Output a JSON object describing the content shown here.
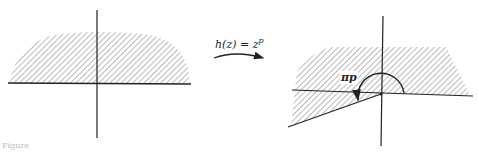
{
  "diagram": {
    "type": "conformal-mapping",
    "left_panel": {
      "description": "upper half-plane (shaded)",
      "axes": {
        "horizontal": true,
        "vertical": true
      }
    },
    "mapping": {
      "label": "h(z) = z",
      "exponent": "p",
      "arrow": "curved-right"
    },
    "right_panel": {
      "description": "sector of angle πp (shaded)",
      "angle_label": "πp",
      "axes": {
        "horizontal": true,
        "vertical": true
      }
    },
    "caption": "Figure"
  },
  "colors": {
    "ink": "#222222",
    "hatch": "#555555",
    "background": "#ffffff"
  }
}
